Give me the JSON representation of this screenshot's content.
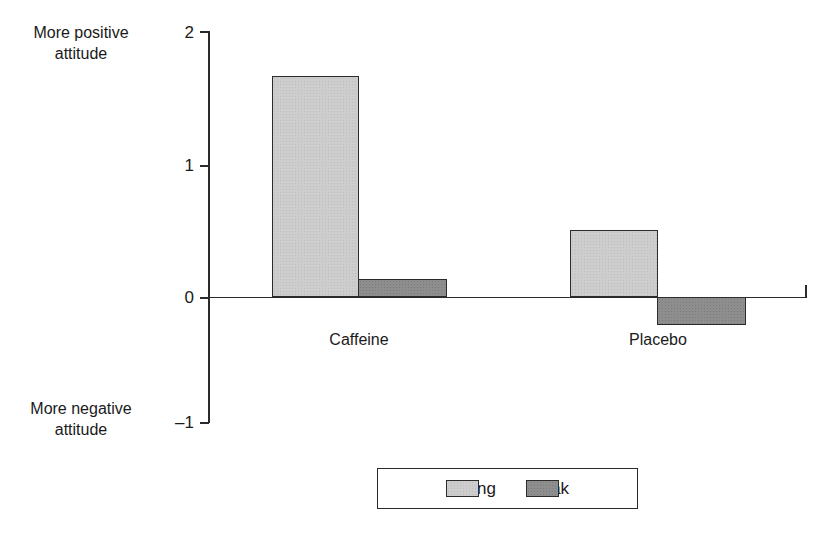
{
  "chart_data": {
    "type": "bar",
    "title": "",
    "xlabel": "",
    "ylabel": "",
    "categories": [
      "Caffeine",
      "Placebo"
    ],
    "series": [
      {
        "name": "Strong",
        "values": [
          1.69,
          0.51
        ],
        "color": "#cdcdcd"
      },
      {
        "name": "Weak",
        "values": [
          0.14,
          -0.21
        ],
        "color": "#8e8e8e"
      }
    ],
    "ylim": [
      -1,
      2
    ],
    "yticks": [
      2,
      1,
      0,
      -1
    ],
    "ytick_labels": [
      "2",
      "1",
      "0",
      "–1"
    ],
    "grid": false,
    "legend_position": "bottom",
    "axis_captions": {
      "top_line1": "More positive",
      "top_line2": "attitude",
      "bottom_line1": "More negative",
      "bottom_line2": "attitude"
    }
  },
  "axis": {
    "tick_2": "2",
    "tick_1": "1",
    "tick_0": "0",
    "tick_minus1": "–1"
  },
  "captions": {
    "positive": "More positive\nattitude",
    "positive_line1": "More positive",
    "positive_line2": "attitude",
    "negative_line1": "More negative",
    "negative_line2": "attitude"
  },
  "categories": {
    "caffeine": "Caffeine",
    "placebo": "Placebo"
  },
  "legend": {
    "items": [
      {
        "label": "Strong",
        "color": "#cdcdcd"
      },
      {
        "label": "Weak",
        "color": "#8e8e8e"
      }
    ]
  }
}
